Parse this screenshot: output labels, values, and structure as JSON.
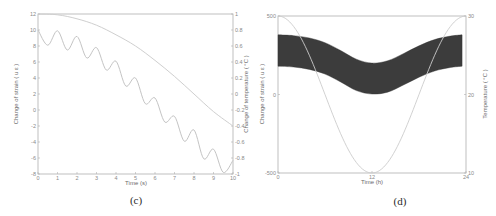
{
  "chart_data": [
    {
      "panel": "c",
      "caption": "(c)",
      "type": "line",
      "xlabel": "Time (s)",
      "ylabel_left": "Change of strain ( u ε )",
      "ylabel_right": "Change of temperature ( °C )",
      "xlim": [
        0,
        10
      ],
      "ylim_left": [
        -8,
        12
      ],
      "ylim_right": [
        -1,
        1
      ],
      "xticks": [
        "0",
        "1",
        "2",
        "3",
        "4",
        "5",
        "6",
        "7",
        "8",
        "9",
        "10"
      ],
      "yticks_left": [
        "12",
        "10",
        "8",
        "6",
        "4",
        "2",
        "0",
        "-2",
        "-4",
        "-6",
        "-8"
      ],
      "yticks_right": [
        "1",
        "0.8",
        "0.6",
        "0.4",
        "0.2",
        "0",
        "-0.2",
        "-0.4",
        "-0.6",
        "-0.8",
        "-1"
      ],
      "grid": false,
      "series": [
        {
          "name": "Change of strain",
          "axis": "left",
          "x": [
            0,
            0.5,
            1,
            1.5,
            2,
            2.5,
            3,
            3.5,
            4,
            4.5,
            5,
            5.5,
            6,
            6.5,
            7,
            7.5,
            8,
            8.5,
            9,
            9.5,
            10
          ],
          "values": [
            10,
            8.1,
            9.9,
            7.5,
            9.2,
            6.5,
            7.8,
            5.0,
            6.1,
            3.0,
            4.0,
            0.8,
            1.5,
            -1.5,
            -0.8,
            -3.9,
            -2.5,
            -6.1,
            -4.9,
            -7.8,
            -6.3
          ]
        },
        {
          "name": "Change of temperature",
          "axis": "right",
          "x": [
            0,
            1,
            2,
            3,
            4,
            5,
            6,
            7,
            8,
            9,
            10
          ],
          "values": [
            1.0,
            0.99,
            0.94,
            0.86,
            0.74,
            0.6,
            0.42,
            0.22,
            0.0,
            -0.22,
            -0.4
          ]
        }
      ]
    },
    {
      "panel": "d",
      "caption": "(d)",
      "type": "area",
      "xlabel": "Time (h)",
      "ylabel_left": "Change of strain ( u ε )",
      "ylabel_right": "Temperature ( °C )",
      "xlim": [
        0,
        24
      ],
      "ylim_left": [
        -500,
        500
      ],
      "ylim_right": [
        10,
        30
      ],
      "xticks": [
        "0",
        "12",
        "24"
      ],
      "yticks_left": [
        "500",
        "0",
        "-500"
      ],
      "yticks_right": [
        "30",
        "20",
        "10"
      ],
      "grid": false,
      "series": [
        {
          "name": "Change of strain (band)",
          "axis": "left",
          "style": "filled-band",
          "x": [
            0,
            2,
            4,
            6,
            8,
            10,
            12,
            14,
            16,
            18,
            20,
            22,
            23.5
          ],
          "upper": [
            380,
            375,
            360,
            330,
            280,
            225,
            200,
            215,
            260,
            310,
            350,
            372,
            380
          ],
          "lower": [
            180,
            175,
            160,
            130,
            80,
            25,
            3,
            15,
            60,
            110,
            150,
            172,
            180
          ]
        },
        {
          "name": "Temperature",
          "axis": "right",
          "x": [
            0,
            2,
            4,
            6,
            8,
            10,
            12,
            14,
            16,
            18,
            20,
            22,
            24
          ],
          "values": [
            30,
            29.3,
            27.5,
            25,
            22.5,
            20.7,
            10,
            20.7,
            22.5,
            25,
            27.5,
            29.3,
            30
          ]
        }
      ]
    }
  ],
  "captions": {
    "c": "(c)",
    "d": "(d)"
  },
  "colors": {
    "axis": "#b0b0b0",
    "line": "#c8c8c8",
    "band": "#3c3c3c",
    "text": "#8a8a8a"
  }
}
